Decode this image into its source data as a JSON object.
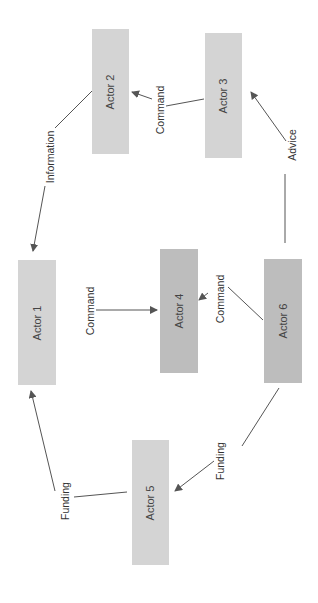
{
  "diagram": {
    "colors": {
      "box_light": "#d4d4d4",
      "box_dark": "#bdbdbd",
      "line": "#555555",
      "text": "#444444"
    },
    "nodes": [
      {
        "id": "actor1",
        "label": "Actor 1"
      },
      {
        "id": "actor2",
        "label": "Actor 2"
      },
      {
        "id": "actor3",
        "label": "Actor 3"
      },
      {
        "id": "actor4",
        "label": "Actor 4"
      },
      {
        "id": "actor5",
        "label": "Actor 5"
      },
      {
        "id": "actor6",
        "label": "Actor 6"
      }
    ],
    "edges": [
      {
        "from": "actor2",
        "to": "actor1",
        "label": "Information"
      },
      {
        "from": "actor3",
        "to": "actor2",
        "label": "Command"
      },
      {
        "from": "actor6",
        "to": "actor3",
        "label": "Advice"
      },
      {
        "from": "actor1",
        "to": "actor4",
        "label": "Command"
      },
      {
        "from": "actor6",
        "to": "actor4",
        "label": "Command"
      },
      {
        "from": "actor6",
        "to": "actor5",
        "label": "Funding"
      },
      {
        "from": "actor5",
        "to": "actor1",
        "label": "Funding"
      }
    ]
  }
}
